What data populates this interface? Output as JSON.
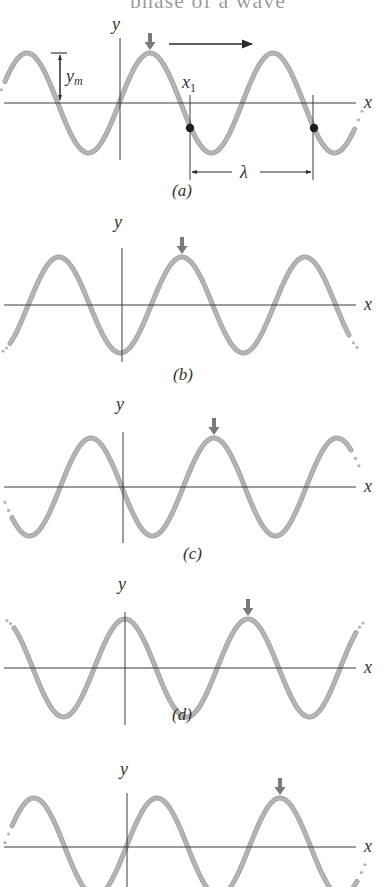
{
  "figure": {
    "top_heading": "phase of a wave",
    "panels": [
      {
        "id": "a",
        "caption": "(a)",
        "axis_y": 103,
        "yaxis_x": 120,
        "yaxis_top": 38,
        "yaxis_bottom": 160,
        "x_start": 5,
        "x_end": 355,
        "amplitude": 50,
        "wavelength": 123,
        "phase_x0": 89,
        "peak_marker_x": 150,
        "x_label_x": 364,
        "y_label_x": 112,
        "y_label_y": 30,
        "caption_x": 172,
        "caption_y": 184,
        "dash_left": true,
        "dash_right": true
      },
      {
        "id": "b",
        "caption": "(b)",
        "axis_y": 305,
        "yaxis_x": 122,
        "yaxis_top": 248,
        "yaxis_bottom": 362,
        "x_start": 10,
        "x_end": 350,
        "amplitude": 48,
        "wavelength": 123,
        "phase_x0": 29,
        "peak_marker_x": 182,
        "x_label_x": 364,
        "y_label_x": 114,
        "y_label_y": 228,
        "caption_x": 173,
        "caption_y": 368,
        "dash_left": true,
        "dash_right": true
      },
      {
        "id": "c",
        "caption": "(c)",
        "axis_y": 487,
        "yaxis_x": 123,
        "yaxis_top": 432,
        "yaxis_bottom": 543,
        "x_start": 12,
        "x_end": 352,
        "amplitude": 49,
        "wavelength": 123,
        "phase_x0": 61,
        "peak_marker_x": 214,
        "x_label_x": 364,
        "y_label_x": 116,
        "y_label_y": 410,
        "caption_x": 183,
        "caption_y": 547,
        "dash_left": true,
        "dash_right": true
      },
      {
        "id": "d",
        "caption": "(d)",
        "axis_y": 668,
        "yaxis_x": 125,
        "yaxis_top": 612,
        "yaxis_bottom": 725,
        "x_start": 14,
        "x_end": 356,
        "amplitude": 49,
        "wavelength": 123,
        "phase_x0": 94,
        "peak_marker_x": 248,
        "x_label_x": 364,
        "y_label_x": 118,
        "y_label_y": 590,
        "caption_x": 172,
        "caption_y": 708,
        "dash_left": true,
        "dash_right": true
      },
      {
        "id": "e",
        "caption": "(e)",
        "axis_y": 847,
        "yaxis_x": 127,
        "yaxis_top": 793,
        "yaxis_bottom": 887,
        "x_start": 12,
        "x_end": 358,
        "amplitude": 49,
        "wavelength": 123,
        "phase_x0": 5,
        "peak_marker_x": 280,
        "x_label_x": 364,
        "y_label_x": 120,
        "y_label_y": 775,
        "caption_x": 0,
        "caption_y": 0,
        "dash_left": true,
        "dash_right": true
      }
    ],
    "annotations": {
      "amplitude_label_main": "y",
      "amplitude_label_sub": "m",
      "position_label_main": "x",
      "position_label_sub": "1",
      "wavelength_label": "λ",
      "x_axis_label": "x",
      "y_axis_label": "y",
      "direction_arrow": "→"
    },
    "colors": {
      "wave": "#b4b4b4",
      "wave_edge": "#a0a0a0",
      "axis": "#3a3a3a",
      "marker_arrow": "#7a7a7a",
      "dot": "#1e1e1e"
    }
  }
}
